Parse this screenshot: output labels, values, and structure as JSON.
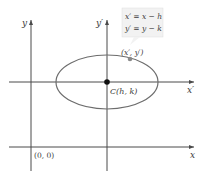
{
  "diagram": {
    "axes": {
      "original_x_label": "x",
      "original_y_label": "y",
      "translated_x_label": "x′",
      "translated_y_label": "y′",
      "origin_label": "(0, 0)"
    },
    "center": {
      "label": "C(h, k)"
    },
    "point": {
      "label": "(x′, y′)"
    },
    "equations": {
      "line1": "x′ = x − h",
      "line2": "y′ = y − k"
    },
    "colors": {
      "axis": "#4a4a4a",
      "ellipse": "#6d6d6d",
      "point": "#8a8a8a",
      "center": "#111111",
      "box_bg": "#f2f2f2",
      "text": "#3a3a3a"
    }
  }
}
